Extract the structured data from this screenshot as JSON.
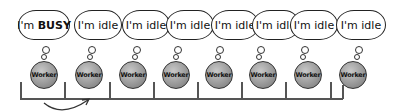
{
  "diagram": {
    "workers": [
      {
        "label": "Worker",
        "status": "I'm BUSY",
        "status_prefix": "I'm ",
        "status_word": "BUSY",
        "busy": true
      },
      {
        "label": "Worker",
        "status": "I'm idle",
        "busy": false
      },
      {
        "label": "Worker",
        "status": "I'm idle",
        "busy": false
      },
      {
        "label": "Worker",
        "status": "I'm idle",
        "busy": false
      },
      {
        "label": "Worker",
        "status": "I'm idle",
        "busy": false
      },
      {
        "label": "Worker",
        "status": "I'm idle",
        "busy": false
      },
      {
        "label": "Worker",
        "status": "I'm idle",
        "busy": false
      },
      {
        "label": "Worker",
        "status": "I'm idle",
        "busy": false
      }
    ],
    "arrow": {
      "from_slot": 1,
      "to_slot": 2,
      "meaning": "task-passed-to-next-worker"
    },
    "colors": {
      "stroke": "#222222",
      "worker_fill": "#9a9a9a",
      "background": "#ffffff"
    }
  }
}
